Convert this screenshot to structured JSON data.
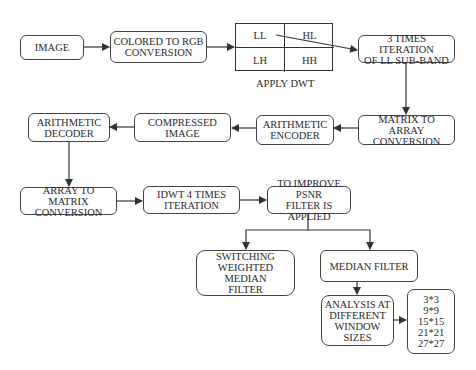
{
  "diagram": {
    "nodes": {
      "image": "IMAGE",
      "rgb": "COLORED TO RGB\nCONVERSION",
      "dwt": {
        "ll": "LL",
        "hl": "HL",
        "lh": "LH",
        "hh": "HH",
        "caption": "APPLY DWT"
      },
      "iter": "3 TIMES ITERATION\nOF LL SUB-BAND",
      "m2a": "MATRIX TO ARRAY\nCONVERSION",
      "enc": "ARITHMETIC\nENCODER",
      "comp": "COMPRESSED\nIMAGE",
      "dec": "ARITHMETIC\nDECODER",
      "a2m": "ARRAY TO MATRIX\nCONVERSION",
      "idwt": "IDWT 4 TIMES\nITERATION",
      "psnr": "TO IMPROVE PSNR\nFILTER IS APPLIED",
      "swmf": "SWITCHING\nWEIGHTED MEDIAN\nFILTER",
      "median": "MEDIAN FILTER",
      "analysis": "ANALYSIS AT\nDIFFERENT\nWINDOW\nSIZES",
      "sizes": "3*3\n9*9\n15*15\n21*21\n27*27"
    },
    "edges": [
      [
        "image",
        "rgb"
      ],
      [
        "rgb",
        "dwt"
      ],
      [
        "dwt.ll",
        "iter"
      ],
      [
        "iter",
        "m2a"
      ],
      [
        "m2a",
        "enc"
      ],
      [
        "enc",
        "comp"
      ],
      [
        "comp",
        "dec"
      ],
      [
        "dec",
        "a2m"
      ],
      [
        "a2m",
        "idwt"
      ],
      [
        "idwt",
        "psnr"
      ],
      [
        "psnr",
        "swmf"
      ],
      [
        "psnr",
        "median"
      ],
      [
        "median",
        "analysis"
      ],
      [
        "analysis",
        "sizes"
      ]
    ],
    "colors": {
      "stroke": "#444444",
      "text": "#2b2b2b",
      "background": "#ffffff"
    }
  }
}
